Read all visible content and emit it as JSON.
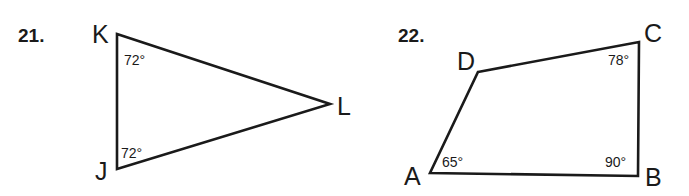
{
  "problems": [
    {
      "number": "21.",
      "shape": "triangle",
      "vertices": [
        {
          "label": "K",
          "x": 117,
          "y": 34
        },
        {
          "label": "L",
          "x": 330,
          "y": 104
        },
        {
          "label": "J",
          "x": 117,
          "y": 169
        }
      ],
      "angles": [
        {
          "vertex": "K",
          "label": "72°"
        },
        {
          "vertex": "J",
          "label": "72°"
        }
      ]
    },
    {
      "number": "22.",
      "shape": "quadrilateral",
      "vertices": [
        {
          "label": "D",
          "x": 478,
          "y": 72
        },
        {
          "label": "C",
          "x": 639,
          "y": 42
        },
        {
          "label": "B",
          "x": 638,
          "y": 176
        },
        {
          "label": "A",
          "x": 430,
          "y": 173
        }
      ],
      "angles": [
        {
          "vertex": "C",
          "label": "78°"
        },
        {
          "vertex": "B",
          "label": "90°"
        },
        {
          "vertex": "A",
          "label": "65°"
        }
      ]
    }
  ]
}
